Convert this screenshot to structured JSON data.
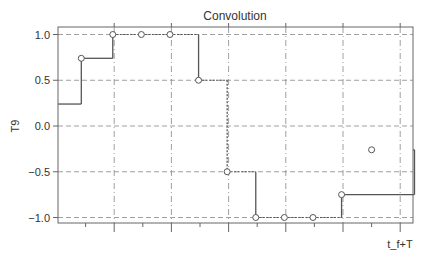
{
  "chart_data": {
    "type": "line",
    "step": true,
    "title": "Convolution",
    "xlabel": "t_f+T",
    "ylabel": "T9",
    "ylim": [
      -1.08,
      1.08
    ],
    "yticks": [
      1.0,
      0.5,
      0.0,
      -0.5,
      -1.0
    ],
    "ytick_labels": [
      "1.0",
      "0.5",
      "0.0",
      "−0.5",
      "−1.0"
    ],
    "xlim": [
      0,
      12.5
    ],
    "xticks_major": [
      2,
      4,
      6,
      8,
      10,
      12
    ],
    "xticks_minor": [
      1,
      3,
      5,
      7,
      9,
      11
    ],
    "xtick_labels": [],
    "grid": true,
    "legend": null,
    "series": [
      {
        "name": "T9",
        "step_x": [
          0,
          0.85,
          1.95,
          2.95,
          3.95,
          4.95,
          5.95,
          6.95,
          7.95,
          8.95,
          9.95,
          12.5
        ],
        "values": [
          0.24,
          0.74,
          1.0,
          1.0,
          1.0,
          0.5,
          -0.5,
          -1.0,
          -1.0,
          -1.0,
          -0.75,
          -0.26
        ],
        "markers": [
          {
            "x": 0.85,
            "y": 0.74
          },
          {
            "x": 1.95,
            "y": 1.0
          },
          {
            "x": 2.95,
            "y": 1.0
          },
          {
            "x": 3.95,
            "y": 1.0
          },
          {
            "x": 4.95,
            "y": 0.5
          },
          {
            "x": 5.95,
            "y": -0.5
          },
          {
            "x": 6.95,
            "y": -1.0
          },
          {
            "x": 7.95,
            "y": -1.0
          },
          {
            "x": 8.95,
            "y": -1.0
          },
          {
            "x": 9.95,
            "y": -0.75
          },
          {
            "x": 11.0,
            "y": -0.26
          }
        ]
      }
    ]
  },
  "colors": {
    "line": "#555555",
    "grid": "#888888",
    "axes": "#666666",
    "marker_fill": "#ffffff"
  }
}
